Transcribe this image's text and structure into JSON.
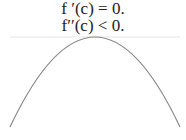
{
  "equations": {
    "first_derivative": "f ′(c) = 0.",
    "second_derivative": "f′′(c) < 0."
  },
  "figure": {
    "curve": "concave-down parabola (local maximum)",
    "tangent": "horizontal tangent line at peak",
    "curve_color": "#888888",
    "tangent_color": "#e6e6e6"
  }
}
